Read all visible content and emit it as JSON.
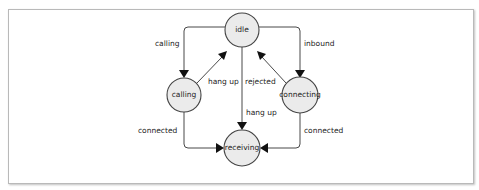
{
  "diagram": {
    "title": "",
    "nodes": [
      {
        "id": "idle",
        "label": "idle"
      },
      {
        "id": "calling",
        "label": "calling"
      },
      {
        "id": "connecting",
        "label": "connecting"
      },
      {
        "id": "receiving",
        "label": "receiving"
      }
    ],
    "edges": [
      {
        "from": "idle",
        "to": "calling",
        "label": "calling"
      },
      {
        "from": "idle",
        "to": "connecting",
        "label": "inbound"
      },
      {
        "from": "calling",
        "to": "idle",
        "label": "hang up"
      },
      {
        "from": "connecting",
        "to": "idle",
        "label": "rejected"
      },
      {
        "from": "idle",
        "to": "receiving",
        "label": "hang up"
      },
      {
        "from": "calling",
        "to": "receiving",
        "label": "connected"
      },
      {
        "from": "connecting",
        "to": "receiving",
        "label": "connected"
      }
    ],
    "colors": {
      "node_fill": "#ebebeb",
      "node_stroke": "#444444",
      "edge": "#333333",
      "frame_border": "#b9b9b9"
    }
  }
}
